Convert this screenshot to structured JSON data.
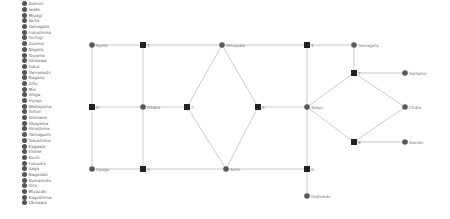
{
  "legend": {
    "items": [
      "Aomori",
      "Iwate",
      "Miyagi",
      "Akita",
      "Yamagata",
      "Fukushima",
      "Tochigi",
      "Gunma",
      "Niigata",
      "Toyama",
      "Ishikawa",
      "Fukui",
      "Yamanashi",
      "Nagano",
      "Gifu",
      "Mie",
      "Shiga",
      "Hyogo",
      "Wakayama",
      "Tottori",
      "Shimane",
      "Okayama",
      "Hiroshima",
      "Yamaguchi",
      "Tokushima",
      "Kagawa",
      "Ehime",
      "Kochi",
      "Fukuoka",
      "Saga",
      "Nagasaki",
      "Kumamoto",
      "Oita",
      "Miyazaki",
      "Kagoshima",
      "Okinawa"
    ],
    "dot_color": "#555555"
  },
  "diagram": {
    "edge_color": "#c4c4c4",
    "circle_color": "#5a5a5a",
    "square_color": "#222222",
    "nodes": [
      {
        "id": "kyoto",
        "label": "Kyoto",
        "shape": "circle",
        "x": 92,
        "y": 45
      },
      {
        "id": "j1",
        "label": "1",
        "shape": "square",
        "x": 143,
        "y": 45
      },
      {
        "id": "shizuoka",
        "label": "Shizuoka",
        "shape": "circle",
        "x": 222,
        "y": 45
      },
      {
        "id": "j4",
        "label": "4",
        "shape": "square",
        "x": 307,
        "y": 45
      },
      {
        "id": "yamagata",
        "label": "Yamagata",
        "shape": "circle",
        "x": 354,
        "y": 45
      },
      {
        "id": "j7",
        "label": "7",
        "shape": "square",
        "x": 354,
        "y": 73
      },
      {
        "id": "saitama",
        "label": "Saitama",
        "shape": "circle",
        "x": 405,
        "y": 73
      },
      {
        "id": "j0",
        "label": "0",
        "shape": "square",
        "x": 92,
        "y": 107
      },
      {
        "id": "osaka",
        "label": "Osaka",
        "shape": "circle",
        "x": 143,
        "y": 107
      },
      {
        "id": "j2",
        "label": "2",
        "shape": "square",
        "x": 187,
        "y": 107
      },
      {
        "id": "j5",
        "label": "5",
        "shape": "square",
        "x": 258,
        "y": 107
      },
      {
        "id": "tokyo",
        "label": "Tokyo",
        "shape": "circle",
        "x": 307,
        "y": 107
      },
      {
        "id": "chiba",
        "label": "Chiba",
        "shape": "circle",
        "x": 405,
        "y": 107
      },
      {
        "id": "j8",
        "label": "8",
        "shape": "square",
        "x": 354,
        "y": 142
      },
      {
        "id": "ibaraki",
        "label": "Ibaraki",
        "shape": "circle",
        "x": 405,
        "y": 142
      },
      {
        "id": "hyogo",
        "label": "Hyogo",
        "shape": "circle",
        "x": 92,
        "y": 169
      },
      {
        "id": "j3",
        "label": "3",
        "shape": "square",
        "x": 143,
        "y": 169
      },
      {
        "id": "aichi",
        "label": "Aichi",
        "shape": "circle",
        "x": 226,
        "y": 169
      },
      {
        "id": "j6",
        "label": "6",
        "shape": "square",
        "x": 307,
        "y": 169
      },
      {
        "id": "hokkaido",
        "label": "Hokkaido",
        "shape": "circle",
        "x": 307,
        "y": 196
      }
    ],
    "edges": [
      [
        "kyoto",
        "j1"
      ],
      [
        "j1",
        "shizuoka"
      ],
      [
        "shizuoka",
        "j4"
      ],
      [
        "j4",
        "yamagata"
      ],
      [
        "kyoto",
        "j0"
      ],
      [
        "j0",
        "hyogo"
      ],
      [
        "j1",
        "osaka"
      ],
      [
        "osaka",
        "j3"
      ],
      [
        "j0",
        "osaka"
      ],
      [
        "osaka",
        "j2"
      ],
      [
        "hyogo",
        "j3"
      ],
      [
        "j3",
        "aichi"
      ],
      [
        "aichi",
        "j6"
      ],
      [
        "j2",
        "shizuoka"
      ],
      [
        "j2",
        "aichi"
      ],
      [
        "shizuoka",
        "j5"
      ],
      [
        "aichi",
        "j5"
      ],
      [
        "j5",
        "tokyo"
      ],
      [
        "j4",
        "tokyo"
      ],
      [
        "tokyo",
        "j6"
      ],
      [
        "j6",
        "hokkaido"
      ],
      [
        "yamagata",
        "j7"
      ],
      [
        "j7",
        "saitama"
      ],
      [
        "j7",
        "tokyo"
      ],
      [
        "j7",
        "chiba"
      ],
      [
        "tokyo",
        "j8"
      ],
      [
        "chiba",
        "j8"
      ],
      [
        "j8",
        "ibaraki"
      ]
    ]
  }
}
